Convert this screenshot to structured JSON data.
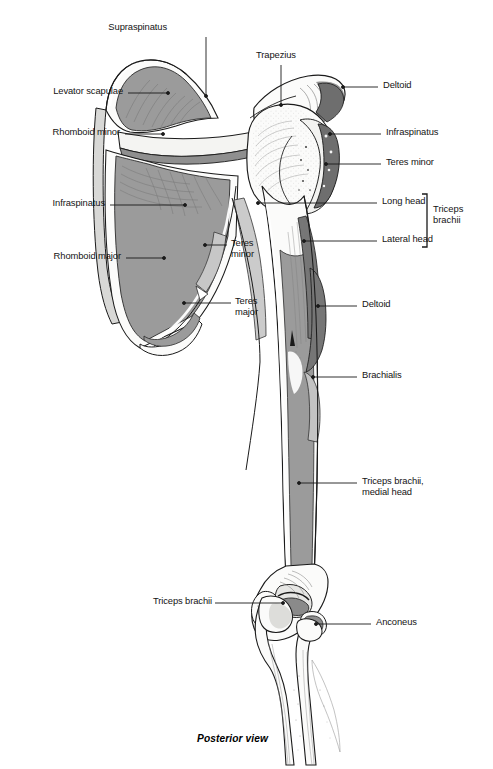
{
  "figure": {
    "caption": "Posterior view",
    "view": "Posterior",
    "width": 493,
    "height": 769
  },
  "palette": {
    "background": "#ffffff",
    "line": "#1a1a1a",
    "bone_fill": "#fbfbfa",
    "bone_shadow": "#e2e2e0",
    "muscle_mid_gray": "#9b9b9b",
    "muscle_dark_gray": "#767676",
    "muscle_light_gray": "#c9c9c9",
    "leader_line": "#1a1a1a",
    "text": "#141414"
  },
  "labels": [
    {
      "id": "supraspinatus-top",
      "text": "Supraspinatus",
      "side": "top",
      "align": "center",
      "x": 167,
      "y": 22,
      "leader": {
        "type": "vertical",
        "x1": 206,
        "y1": 37,
        "x2": 206,
        "y2": 96,
        "dot": true
      }
    },
    {
      "id": "trapezius",
      "text": "Trapezius",
      "side": "top",
      "align": "center",
      "x": 256,
      "y": 50,
      "leader": {
        "type": "vertical",
        "x1": 281,
        "y1": 65,
        "x2": 281,
        "y2": 105,
        "dot": true
      }
    },
    {
      "id": "levator-scapulae",
      "text": "Levator scapulae",
      "side": "left",
      "align": "right",
      "x": 33,
      "y": 87,
      "leader": {
        "type": "horizontal",
        "x1": 128,
        "y1": 93,
        "x2": 168,
        "y2": 93,
        "dot": true
      }
    },
    {
      "id": "rhomboid-minor",
      "text": "Rhomboid minor",
      "side": "left",
      "align": "right",
      "x": 27,
      "y": 128,
      "leader": {
        "type": "horizontal",
        "x1": 125,
        "y1": 134,
        "x2": 163,
        "y2": 134,
        "dot": true
      }
    },
    {
      "id": "infraspinatus-left",
      "text": "Infraspinatus",
      "side": "left",
      "align": "right",
      "x": 41,
      "y": 199,
      "leader": {
        "type": "horizontal",
        "x1": 110,
        "y1": 205,
        "x2": 185,
        "y2": 205,
        "dot": true
      }
    },
    {
      "id": "rhomboid-major",
      "text": "Rhomboid major",
      "side": "left",
      "align": "right",
      "x": 28,
      "y": 252,
      "leader": {
        "type": "horizontal",
        "x1": 126,
        "y1": 258,
        "x2": 164,
        "y2": 258,
        "dot": true
      }
    },
    {
      "id": "deltoid-top",
      "text": "Deltoid",
      "side": "right",
      "align": "left",
      "x": 383,
      "y": 81,
      "leader": {
        "type": "horizontal",
        "x1": 343,
        "y1": 87,
        "x2": 378,
        "y2": 87,
        "dot": true
      }
    },
    {
      "id": "infraspinatus-right",
      "text": "Infraspinatus",
      "side": "right",
      "align": "left",
      "x": 386,
      "y": 128,
      "leader": {
        "type": "horizontal",
        "x1": 340,
        "y1": 134,
        "x2": 381,
        "y2": 134,
        "dot": true
      }
    },
    {
      "id": "teres-minor-right",
      "text": "Teres minor",
      "side": "right",
      "align": "left",
      "x": 386,
      "y": 158,
      "leader": {
        "type": "horizontal",
        "x1": 326,
        "y1": 164,
        "x2": 381,
        "y2": 164,
        "dot": true
      }
    },
    {
      "id": "long-head",
      "text": "Long head",
      "side": "right",
      "align": "left",
      "x": 382,
      "y": 197,
      "leader": {
        "type": "horizontal",
        "x1": 262,
        "y1": 203,
        "x2": 377,
        "y2": 203,
        "dot": true
      }
    },
    {
      "id": "lateral-head",
      "text": "Lateral head",
      "side": "right",
      "align": "left",
      "x": 382,
      "y": 235,
      "leader": {
        "type": "horizontal",
        "x1": 304,
        "y1": 241,
        "x2": 377,
        "y2": 241,
        "dot": true
      }
    },
    {
      "id": "teres-minor-inner",
      "text": "Teres\nminor",
      "side": "inner-right",
      "align": "left",
      "x": 231,
      "y": 239,
      "leader": {
        "type": "horizontal",
        "x1": 205,
        "y1": 245,
        "x2": 227,
        "y2": 245,
        "dot": true
      }
    },
    {
      "id": "teres-major-inner",
      "text": "Teres\nmajor",
      "side": "inner-right",
      "align": "left",
      "x": 235,
      "y": 297,
      "leader": {
        "type": "horizontal",
        "x1": 196,
        "y1": 303,
        "x2": 231,
        "y2": 303,
        "dot": true
      }
    },
    {
      "id": "deltoid-shaft",
      "text": "Deltoid",
      "side": "right",
      "align": "left",
      "x": 362,
      "y": 300,
      "leader": {
        "type": "horizontal",
        "x1": 326,
        "y1": 306,
        "x2": 357,
        "y2": 306,
        "dot": true
      }
    },
    {
      "id": "brachialis",
      "text": "Brachialis",
      "side": "right",
      "align": "left",
      "x": 362,
      "y": 371,
      "leader": {
        "type": "horizontal",
        "x1": 321,
        "y1": 377,
        "x2": 357,
        "y2": 377,
        "dot": true
      }
    },
    {
      "id": "triceps-medial-head",
      "text": "Triceps brachii,\nmedial head",
      "side": "right",
      "align": "left",
      "x": 362,
      "y": 477,
      "leader": {
        "type": "horizontal",
        "x1": 303,
        "y1": 483,
        "x2": 357,
        "y2": 483,
        "dot": true
      }
    },
    {
      "id": "triceps-brachii-left",
      "text": "Triceps brachii",
      "side": "left",
      "align": "right",
      "x": 142,
      "y": 597,
      "leader": {
        "type": "horizontal",
        "x1": 215,
        "y1": 603,
        "x2": 281,
        "y2": 603,
        "dot": true
      }
    },
    {
      "id": "anconeus",
      "text": "Anconeus",
      "side": "right",
      "align": "left",
      "x": 376,
      "y": 618,
      "leader": {
        "type": "horizontal",
        "x1": 327,
        "y1": 624,
        "x2": 371,
        "y2": 624,
        "dot": true
      }
    }
  ],
  "bracket_group": {
    "id": "triceps-brachii-bracket",
    "text": "Triceps\nbrachii",
    "members": [
      "Long head",
      "Lateral head"
    ],
    "text_x": 437,
    "text_y": 205,
    "bracket": {
      "x": 427,
      "y_top": 194,
      "y_bottom": 247,
      "tick": 5
    }
  }
}
